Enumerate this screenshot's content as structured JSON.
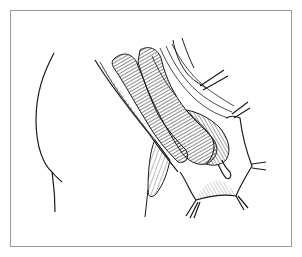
{
  "figure": {
    "colors": {
      "ink": "#1a1a1a",
      "frame": "#9a9a9a",
      "background": "#ffffff"
    }
  }
}
